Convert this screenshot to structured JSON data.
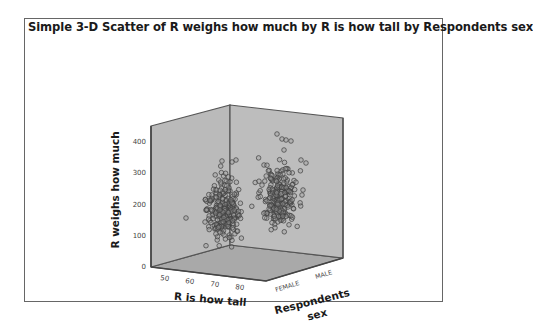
{
  "chart_data": {
    "type": "scatter",
    "subtype": "3d",
    "title": "Simple 3-D Scatter of R weighs how much by R is how tall by Respondents sex",
    "xlabel": "R is how tall",
    "ylabel": "R weighs how much",
    "zlabel": "Respondents sex",
    "x_ticks": [
      "50",
      "60",
      "70",
      "80"
    ],
    "y_ticks": [
      "0",
      "100",
      "200",
      "300",
      "400"
    ],
    "z_ticks": [
      "FEMALE",
      "MALE"
    ],
    "ylim": [
      0,
      450
    ],
    "xlim": [
      45,
      85
    ],
    "grid": false,
    "legend": null,
    "series": [
      {
        "name": "FEMALE",
        "approx_center": {
          "height": 64,
          "weight": 145
        },
        "approx_range": {
          "height": [
            52,
            75
          ],
          "weight": [
            90,
            260
          ]
        },
        "outliers": [
          {
            "height": 50,
            "weight": 150
          },
          {
            "height": 55,
            "weight": 140
          }
        ]
      },
      {
        "name": "MALE",
        "approx_center": {
          "height": 70,
          "weight": 185
        },
        "approx_range": {
          "height": [
            62,
            78
          ],
          "weight": [
            110,
            300
          ]
        },
        "outliers": [
          {
            "height": 70,
            "weight": 400
          },
          {
            "height": 72,
            "weight": 390
          }
        ]
      }
    ],
    "colors": {
      "wall": "#b9b9b9",
      "floor": "#a9a9a9",
      "edge": "#555555",
      "marker_stroke": "#3e3e3e"
    }
  },
  "labels": {
    "title": "Simple 3-D Scatter of R weighs how much by R is how tall by Respondents sex",
    "ylabel": "R weighs how much",
    "xlabel": "R is how tall",
    "zlabel_line1": "Respondents",
    "zlabel_line2": "sex",
    "y_ticks": [
      "400",
      "300",
      "200",
      "100",
      "0"
    ],
    "x_ticks": [
      "50",
      "60",
      "70",
      "80"
    ],
    "z_ticks": [
      "FEMALE",
      "MALE"
    ]
  }
}
